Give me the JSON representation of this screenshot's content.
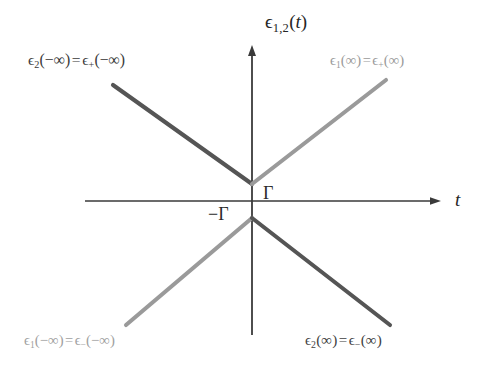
{
  "figure": {
    "title": "",
    "background_color": "#ffffff",
    "axes": {
      "y_axis_label": "ε1,2(t)",
      "x_axis_label": "t",
      "axis_color": "#3a3a3a",
      "origin_px": [
        252,
        201
      ],
      "y_axis_top_px": 45,
      "y_axis_bottom_px": 335,
      "x_axis_left_px": 85,
      "x_axis_right_px": 441
    },
    "gap_labels": {
      "upper": "Γ",
      "lower": "−Γ"
    },
    "branch_labels": {
      "top_left": {
        "text": "ϵ2(−∞) = ϵ+(−∞)",
        "eps_main_sub": "2",
        "eps_main_arg": "(−∞)",
        "eps_alt_sub": "+",
        "eps_alt_arg": "(−∞)",
        "color": "#3a3a3a"
      },
      "top_right": {
        "text": "ϵ1(∞) = ϵ+(∞)",
        "eps_main_sub": "1",
        "eps_main_arg": "(∞)",
        "eps_alt_sub": "+",
        "eps_alt_arg": "(∞)",
        "color": "#9a9a9a"
      },
      "bottom_left": {
        "text": "ϵ1(−∞) = ϵ−(−∞)",
        "eps_main_sub": "1",
        "eps_main_arg": "(−∞)",
        "eps_alt_sub": "−",
        "eps_alt_arg": "(−∞)",
        "color": "#a0a0a0"
      },
      "bottom_right": {
        "text": "ϵ2(∞) = ϵ−(∞)",
        "eps_main_sub": "2",
        "eps_main_arg": "(∞)",
        "eps_alt_sub": "−",
        "eps_alt_arg": "(∞)",
        "color": "#3f3f3f"
      }
    }
  },
  "chart_data": {
    "type": "line",
    "title": "",
    "xlabel": "t",
    "ylabel": "ε1,2(t)",
    "xlim": [
      -170,
      190
    ],
    "ylim": [
      -135,
      155
    ],
    "grid": false,
    "legend": "none",
    "note": "Avoided-crossing (Landau-Zener) adiabatic energy level diagram; two branches meet a gap of 2Γ at t=0.",
    "series": [
      {
        "name": "upper-left branch",
        "label": "ϵ2(−∞) = ϵ+(−∞)",
        "color": "#555555",
        "points_px": [
          [
            113,
            85
          ],
          [
            252,
            184
          ]
        ],
        "points_data": [
          [
            -139,
            116
          ],
          [
            0,
            17
          ]
        ]
      },
      {
        "name": "upper-right branch",
        "label": "ϵ1(∞) = ϵ+(∞)",
        "color": "#9a9a9a",
        "points_px": [
          [
            252,
            184
          ],
          [
            386,
            80
          ]
        ],
        "points_data": [
          [
            0,
            17
          ],
          [
            134,
            121
          ]
        ]
      },
      {
        "name": "lower-left branch",
        "label": "ϵ1(−∞) = ϵ−(−∞)",
        "color": "#9a9a9a",
        "points_px": [
          [
            126,
            325
          ],
          [
            252,
            218
          ]
        ],
        "points_data": [
          [
            -126,
            -124
          ],
          [
            0,
            -17
          ]
        ]
      },
      {
        "name": "lower-right branch",
        "label": "ϵ2(∞) = ϵ−(∞)",
        "color": "#555555",
        "points_px": [
          [
            252,
            218
          ],
          [
            390,
            325
          ]
        ],
        "points_data": [
          [
            0,
            -17
          ],
          [
            138,
            -124
          ]
        ]
      }
    ],
    "annotations": [
      {
        "text": "Γ",
        "x_px": 268,
        "y_px": 192
      },
      {
        "text": "−Γ",
        "x_px": 216,
        "y_px": 213
      }
    ]
  }
}
